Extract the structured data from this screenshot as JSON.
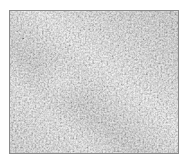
{
  "swatch": {
    "kind": "texture-swatch",
    "texture": "gray stucco noise",
    "colors": {
      "base": "#d6d6d6",
      "light": "#f4f4f4",
      "dark": "#8c8c8c",
      "border": "#8a8a8a"
    }
  }
}
